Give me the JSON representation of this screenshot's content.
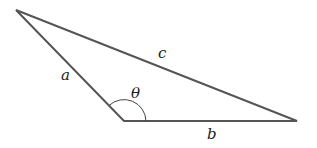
{
  "diagram": {
    "type": "triangle",
    "vertices": {
      "top_left": [
        16,
        10
      ],
      "bottom": [
        124,
        121
      ],
      "right": [
        297,
        121
      ]
    },
    "labels": {
      "side_a": "a",
      "side_b": "b",
      "side_c": "c",
      "angle": "θ"
    },
    "stroke_color": "#555555"
  }
}
